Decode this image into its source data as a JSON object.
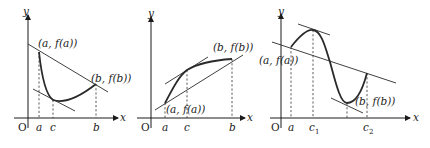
{
  "panels": [
    {
      "id": "panel-1",
      "axis_labels": {
        "x": "x",
        "y": "y",
        "origin": "O"
      },
      "ticks": [
        "a",
        "c",
        "b"
      ],
      "point_labels": {
        "start": "(a, f(a))",
        "end": "(b, f(b))"
      }
    },
    {
      "id": "panel-2",
      "axis_labels": {
        "x": "x",
        "y": "y",
        "origin": "O"
      },
      "ticks": [
        "a",
        "c",
        "b"
      ],
      "point_labels": {
        "start": "(a, f(a))",
        "end": "(b, f(b))"
      }
    },
    {
      "id": "panel-3",
      "axis_labels": {
        "x": "x",
        "y": "y",
        "origin": "O"
      },
      "ticks": [
        "a",
        "c",
        "c"
      ],
      "tick_subscripts": [
        "",
        "1",
        "2"
      ],
      "point_labels": {
        "start": "(a, f(a))",
        "end": "(b, f(b))"
      }
    }
  ],
  "colors": {
    "ink": "#2a2a2a",
    "background": "#ffffff"
  }
}
